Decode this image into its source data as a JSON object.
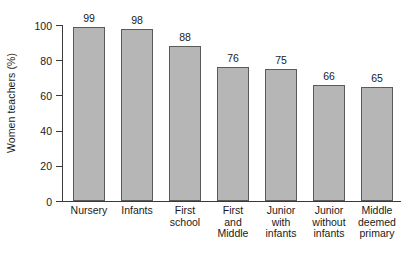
{
  "chart_data": {
    "type": "bar",
    "title": "",
    "xlabel": "",
    "ylabel": "Women teachers (%)",
    "ylim": [
      0,
      100
    ],
    "yticks": [
      0,
      20,
      40,
      60,
      80,
      100
    ],
    "ytick_labels": [
      "0",
      "20",
      "40",
      "60",
      "80",
      "100"
    ],
    "grid": false,
    "legend": null,
    "categories": [
      "Nursery",
      "Infants",
      "First school",
      "First and Middle",
      "Junior with infants",
      "Junior without infants",
      "Middle deemed primary"
    ],
    "category_lines": [
      [
        "Nursery"
      ],
      [
        "Infants"
      ],
      [
        "First",
        "school"
      ],
      [
        "First",
        "and",
        "Middle"
      ],
      [
        "Junior",
        "with",
        "infants"
      ],
      [
        "Junior",
        "without",
        "infants"
      ],
      [
        "Middle",
        "deemed",
        "primary"
      ]
    ],
    "values": [
      99,
      98,
      88,
      76,
      75,
      66,
      65
    ],
    "value_labels": [
      "99",
      "98",
      "88",
      "76",
      "75",
      "66",
      "65"
    ],
    "colors": {
      "bar_fill": "#b6b6b6",
      "bar_stroke": "#5a5a5a",
      "axis": "#3a3a3a",
      "text": "#1a1a1a",
      "background": "#ffffff"
    }
  }
}
